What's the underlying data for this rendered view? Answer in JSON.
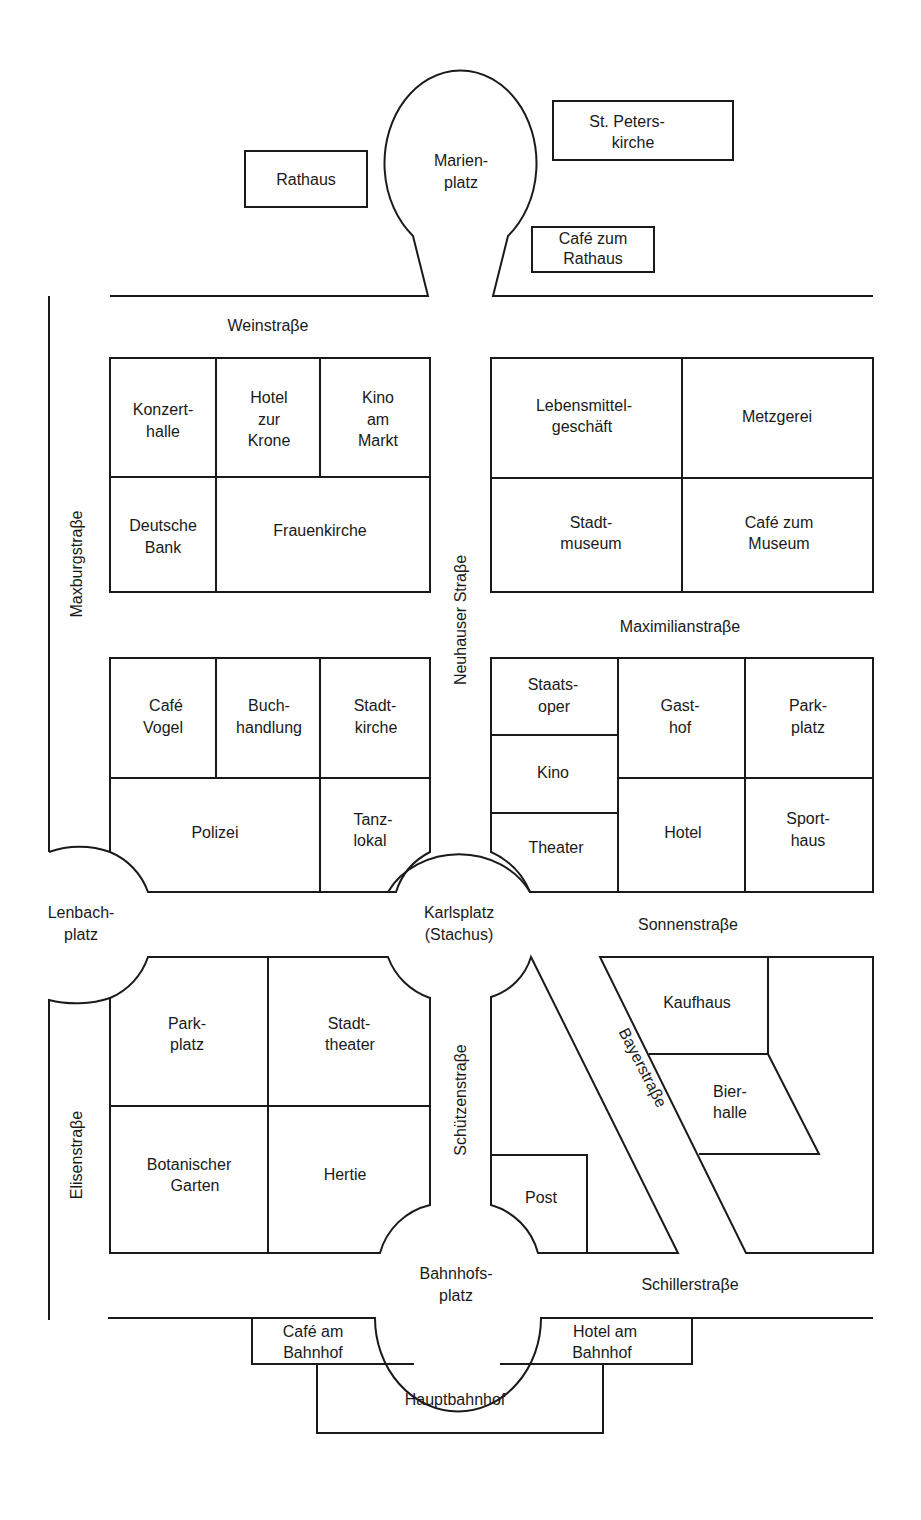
{
  "map": {
    "type": "street-map",
    "city_area": "Munich city center (textbook map)",
    "colors": {
      "line": "#1a1a1a",
      "background": "#ffffff"
    },
    "squares": {
      "marienplatz": [
        "Marien-",
        "platz"
      ],
      "lenbachplatz": [
        "Lenbach-",
        "platz"
      ],
      "karlsplatz": [
        "Karlsplatz",
        "(Stachus)"
      ],
      "bahnhofsplatz": [
        "Bahnhofs-",
        "platz"
      ]
    },
    "streets": {
      "weinstrasse": "Weinstraβe",
      "maxburgstrasse": "Maxburgstraβe",
      "neuhauser_strasse": "Neuhauser Straβe",
      "maximilianstrasse": "Maximilianstraβe",
      "sonnenstrasse": "Sonnenstraβe",
      "elisenstrasse": "Elisenstraβe",
      "schuetzenstrasse": "Schützenstraβe",
      "bayerstrasse": "Bayerstraβe",
      "schillerstrasse": "Schillerstraβe"
    },
    "buildings": {
      "rathaus": [
        "Rathaus"
      ],
      "st_peterskirche": [
        "St. Peters-",
        "kirche"
      ],
      "cafe_zum_rathaus": [
        "Café zum",
        "Rathaus"
      ],
      "konzerthalle": [
        "Konzert-",
        "halle"
      ],
      "hotel_zur_krone": [
        "Hotel",
        "zur",
        "Krone"
      ],
      "kino_am_markt": [
        "Kino",
        "am",
        "Markt"
      ],
      "deutsche_bank": [
        "Deutsche",
        "Bank"
      ],
      "frauenkirche": [
        "Frauenkirche"
      ],
      "lebensmittelgeschaeft": [
        "Lebensmittel-",
        "geschäft"
      ],
      "metzgerei": [
        "Metzgerei"
      ],
      "stadtmuseum": [
        "Stadt-",
        "museum"
      ],
      "cafe_zum_museum": [
        "Café zum",
        "Museum"
      ],
      "cafe_vogel": [
        "Café",
        "Vogel"
      ],
      "buchhandlung": [
        "Buch-",
        "handlung"
      ],
      "stadtkirche": [
        "Stadt-",
        "kirche"
      ],
      "polizei": [
        "Polizei"
      ],
      "tanzlokal": [
        "Tanz-",
        "lokal"
      ],
      "staatsoper": [
        "Staats-",
        "oper"
      ],
      "kino": [
        "Kino"
      ],
      "theater": [
        "Theater"
      ],
      "gasthof": [
        "Gast-",
        "hof"
      ],
      "parkplatz_north": [
        "Park-",
        "platz"
      ],
      "hotel": [
        "Hotel"
      ],
      "sporthaus": [
        "Sport-",
        "haus"
      ],
      "parkplatz_south": [
        "Park-",
        "platz"
      ],
      "stadttheater": [
        "Stadt-",
        "theater"
      ],
      "botanischer_garten": [
        "Botanischer",
        "Garten"
      ],
      "hertie": [
        "Hertie"
      ],
      "post": [
        "Post"
      ],
      "kaufhaus": [
        "Kaufhaus"
      ],
      "bierhalle": [
        "Bier-",
        "halle"
      ],
      "cafe_am_bahnhof": [
        "Café am",
        "Bahnhof"
      ],
      "hotel_am_bahnhof": [
        "Hotel am",
        "Bahnhof"
      ],
      "hauptbahnhof": [
        "Hauptbahnhof"
      ]
    }
  }
}
